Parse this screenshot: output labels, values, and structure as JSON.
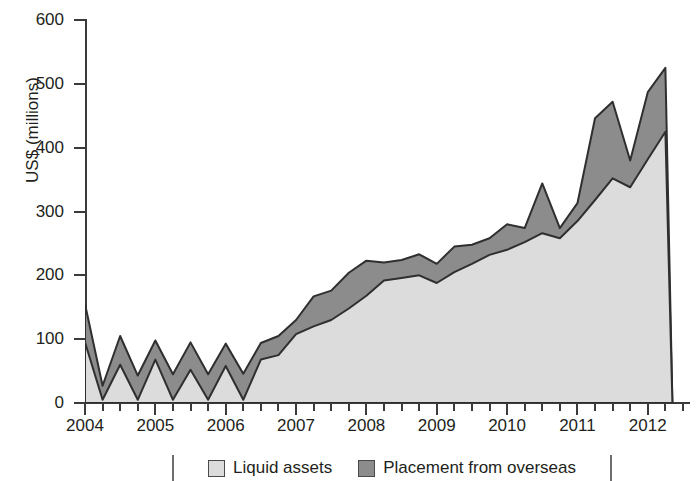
{
  "chart_data": {
    "type": "area",
    "stacked": true,
    "title": "",
    "subtitle": "",
    "xlabel": "",
    "ylabel": "US$ (millions)",
    "ylim": [
      0,
      600
    ],
    "yticks": [
      0,
      100,
      200,
      300,
      400,
      500,
      600
    ],
    "xticklabels": [
      "2004",
      "2005",
      "2006",
      "2007",
      "2008",
      "2009",
      "2010",
      "2011",
      "2012"
    ],
    "xlim": [
      2004.0,
      2012.6
    ],
    "grid": false,
    "legend_position": "bottom",
    "x": [
      2004.0,
      2004.25,
      2004.5,
      2004.75,
      2005.0,
      2005.25,
      2005.5,
      2005.75,
      2006.0,
      2006.25,
      2006.5,
      2006.75,
      2007.0,
      2007.25,
      2007.5,
      2007.75,
      2008.0,
      2008.25,
      2008.5,
      2008.75,
      2009.0,
      2009.25,
      2009.5,
      2009.75,
      2010.0,
      2010.25,
      2010.5,
      2010.75,
      2011.0,
      2011.25,
      2011.5,
      2011.75,
      2012.0,
      2012.25,
      2012.35
    ],
    "series": [
      {
        "name": "Liquid assets",
        "color": "#dcdcdc",
        "values": [
          95,
          5,
          60,
          5,
          68,
          5,
          52,
          5,
          58,
          5,
          68,
          75,
          108,
          120,
          130,
          148,
          168,
          192,
          196,
          200,
          188,
          205,
          218,
          232,
          240,
          252,
          266,
          258,
          285,
          318,
          352,
          338,
          382,
          425,
          0
        ]
      },
      {
        "name": "Placement from overseas",
        "color": "#8c8c8c",
        "values": [
          60,
          22,
          45,
          38,
          30,
          40,
          43,
          40,
          35,
          41,
          26,
          30,
          22,
          47,
          46,
          56,
          55,
          28,
          28,
          33,
          30,
          40,
          30,
          26,
          40,
          22,
          78,
          16,
          28,
          128,
          120,
          42,
          105,
          100,
          0
        ]
      }
    ],
    "totals": [
      155,
      27,
      105,
      43,
      98,
      45,
      95,
      45,
      93,
      46,
      94,
      105,
      130,
      167,
      176,
      204,
      223,
      220,
      224,
      233,
      218,
      245,
      248,
      258,
      280,
      274,
      344,
      274,
      313,
      446,
      472,
      380,
      487,
      525,
      0
    ]
  },
  "legend": {
    "entries": [
      {
        "label": "Liquid assets",
        "color": "#dcdcdc"
      },
      {
        "label": "Placement from overseas",
        "color": "#8c8c8c"
      }
    ]
  }
}
